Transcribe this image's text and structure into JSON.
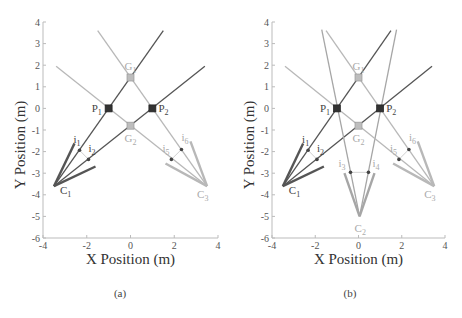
{
  "chart_data": [
    {
      "id": "a",
      "type": "scatter",
      "caption": "(a)",
      "xlabel": "X Position (m)",
      "ylabel": "Y Position (m)",
      "xlim": [
        -4,
        4
      ],
      "ylim": [
        -6,
        4
      ],
      "xticks": [
        -4,
        -2,
        0,
        2,
        4
      ],
      "yticks": [
        4,
        3,
        2,
        1,
        0,
        -1,
        -2,
        -3,
        -4,
        -5,
        -6
      ],
      "grid": false,
      "colors": {
        "dark": "#555555",
        "light": "#b8b8b8",
        "marker_dark": "#333333",
        "marker_light": "#bdbdbd"
      },
      "cameras": [
        {
          "name": "C",
          "sub": "1",
          "pos": [
            -3.5,
            -3.6
          ],
          "tone": "dark",
          "label_offset": [
            6,
            8
          ],
          "frustum": [
            [
              -2.56,
              -1.62
            ],
            [
              -1.6,
              -2.69
            ]
          ],
          "rays": [
            {
              "end": [
                1.5,
                3.6
              ]
            },
            {
              "end": [
                3.4,
                1.95
              ]
            }
          ],
          "image_points": [
            {
              "name": "i",
              "sub": "1",
              "pos": [
                -2.33,
                -1.94
              ],
              "label_offset": [
                -6,
                -7
              ]
            },
            {
              "name": "i",
              "sub": "2",
              "pos": [
                -1.92,
                -2.36
              ],
              "label_offset": [
                0,
                -7
              ]
            }
          ]
        },
        {
          "name": "C",
          "sub": "3",
          "pos": [
            3.5,
            -3.6
          ],
          "tone": "light",
          "label_offset": [
            -10,
            12
          ],
          "frustum": [
            [
              2.74,
              -1.53
            ],
            [
              1.6,
              -2.55
            ]
          ],
          "rays": [
            {
              "end": [
                -1.5,
                3.6
              ]
            },
            {
              "end": [
                -3.4,
                1.95
              ]
            }
          ],
          "image_points": [
            {
              "name": "i",
              "sub": "5",
              "pos": [
                1.87,
                -2.36
              ],
              "label_offset": [
                -9,
                -7
              ]
            },
            {
              "name": "i",
              "sub": "6",
              "pos": [
                2.33,
                -1.9
              ],
              "label_offset": [
                0,
                -8
              ]
            }
          ]
        }
      ],
      "points": [
        {
          "name": "P",
          "sub": "1",
          "pos": [
            -1.0,
            0.0
          ],
          "kind": "true",
          "label_offset": [
            -17,
            4
          ]
        },
        {
          "name": "P",
          "sub": "2",
          "pos": [
            1.0,
            0.0
          ],
          "kind": "true",
          "label_offset": [
            6,
            4
          ]
        },
        {
          "name": "G",
          "sub": "1",
          "pos": [
            0.0,
            1.43
          ],
          "kind": "ghost",
          "label_offset": [
            -6,
            -8
          ]
        },
        {
          "name": "G",
          "sub": "2",
          "pos": [
            0.0,
            -0.8
          ],
          "kind": "ghost",
          "label_offset": [
            -6,
            16
          ]
        }
      ]
    },
    {
      "id": "b",
      "type": "scatter",
      "caption": "(b)",
      "xlabel": "X Position (m)",
      "ylabel": "Y Position (m)",
      "xlim": [
        -4,
        4
      ],
      "ylim": [
        -6,
        4
      ],
      "xticks": [
        -4,
        -2,
        0,
        2,
        4
      ],
      "yticks": [
        4,
        3,
        2,
        1,
        0,
        -1,
        -2,
        -3,
        -4,
        -5,
        -6
      ],
      "grid": false,
      "colors": {
        "dark": "#555555",
        "light": "#b8b8b8",
        "mid": "#a6a6a6",
        "marker_dark": "#333333",
        "marker_light": "#bdbdbd"
      },
      "cameras": [
        {
          "name": "C",
          "sub": "1",
          "pos": [
            -3.5,
            -3.6
          ],
          "tone": "dark",
          "label_offset": [
            6,
            8
          ],
          "frustum": [
            [
              -2.56,
              -1.62
            ],
            [
              -1.6,
              -2.69
            ]
          ],
          "rays": [
            {
              "end": [
                1.5,
                3.6
              ]
            },
            {
              "end": [
                3.4,
                1.95
              ]
            }
          ],
          "image_points": [
            {
              "name": "i",
              "sub": "1",
              "pos": [
                -2.33,
                -1.94
              ],
              "label_offset": [
                -6,
                -7
              ]
            },
            {
              "name": "i",
              "sub": "2",
              "pos": [
                -1.92,
                -2.36
              ],
              "label_offset": [
                0,
                -7
              ]
            }
          ]
        },
        {
          "name": "C",
          "sub": "2",
          "pos": [
            0.05,
            -5.0
          ],
          "tone": "mid",
          "label_offset": [
            -5,
            16
          ],
          "frustum": [
            [
              -0.65,
              -3.0
            ],
            [
              0.74,
              -3.0
            ]
          ],
          "rays": [
            {
              "end": [
                -1.7,
                3.65
              ]
            },
            {
              "end": [
                1.76,
                3.65
              ]
            }
          ],
          "image_points": [
            {
              "name": "i",
              "sub": "3",
              "pos": [
                -0.37,
                -2.96
              ],
              "label_offset": [
                -12,
                -5
              ]
            },
            {
              "name": "i",
              "sub": "4",
              "pos": [
                0.46,
                -2.96
              ],
              "label_offset": [
                4,
                -5
              ]
            }
          ]
        },
        {
          "name": "C",
          "sub": "3",
          "pos": [
            3.5,
            -3.6
          ],
          "tone": "light",
          "label_offset": [
            -10,
            12
          ],
          "frustum": [
            [
              2.74,
              -1.53
            ],
            [
              1.6,
              -2.55
            ]
          ],
          "rays": [
            {
              "end": [
                -1.5,
                3.6
              ]
            },
            {
              "end": [
                -3.4,
                1.95
              ]
            }
          ],
          "image_points": [
            {
              "name": "i",
              "sub": "5",
              "pos": [
                1.87,
                -2.36
              ],
              "label_offset": [
                -9,
                -7
              ]
            },
            {
              "name": "i",
              "sub": "6",
              "pos": [
                2.33,
                -1.9
              ],
              "label_offset": [
                0,
                -8
              ]
            }
          ]
        }
      ],
      "points": [
        {
          "name": "P",
          "sub": "1",
          "pos": [
            -1.0,
            0.0
          ],
          "kind": "true",
          "label_offset": [
            -17,
            4
          ]
        },
        {
          "name": "P",
          "sub": "2",
          "pos": [
            1.0,
            0.0
          ],
          "kind": "true",
          "label_offset": [
            6,
            4
          ]
        },
        {
          "name": "G",
          "sub": "1",
          "pos": [
            0.0,
            1.43
          ],
          "kind": "ghost",
          "label_offset": [
            -6,
            -8
          ]
        },
        {
          "name": "G",
          "sub": "2",
          "pos": [
            0.0,
            -0.8
          ],
          "kind": "ghost",
          "label_offset": [
            -6,
            16
          ]
        }
      ]
    }
  ]
}
